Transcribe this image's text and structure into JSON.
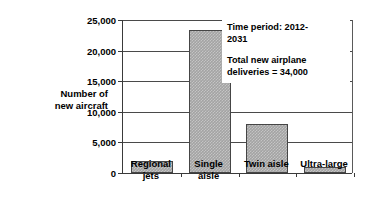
{
  "chart_data": {
    "type": "bar",
    "title": "",
    "subtitle": "",
    "xlabel": "",
    "ylabel": "Number of new aircraft",
    "ylabel_lines": [
      "Number of",
      "new aircraft"
    ],
    "categories": [
      "Regional jets",
      "Single aisle",
      "Twin aisle",
      "Ultra-large"
    ],
    "category_lines": [
      [
        "Regional",
        "jets"
      ],
      [
        "Single",
        "aisle"
      ],
      [
        "Twin aisle"
      ],
      [
        "Ultra-large"
      ]
    ],
    "values": [
      2000,
      23300,
      8000,
      1000
    ],
    "ylim": [
      0,
      25000
    ],
    "ytick_values": [
      0,
      5000,
      10000,
      15000,
      20000,
      25000
    ],
    "ytick_labels": [
      "0",
      "5,000",
      "10,000",
      "15,000",
      "20,000",
      "25,000"
    ],
    "grid": true,
    "grid_axis": "y",
    "legend": false,
    "legend_position": "none",
    "bar_fill_color": "#a3a3a3",
    "bar_edge_color": "#454545",
    "axis_color": "#3a3a3a",
    "background_color": "#ffffff",
    "annotations": [
      {
        "name": "time-period",
        "lines": [
          "Time period: 2012-",
          "2031"
        ]
      },
      {
        "name": "total-deliveries",
        "lines": [
          "Total new airplane",
          "deliveries = 34,000"
        ]
      }
    ]
  },
  "annotation_box": {
    "time_period_line1": "Time period: 2012-",
    "time_period_line2": "2031",
    "total_line1": "Total new airplane",
    "total_line2": "deliveries = 34,000"
  },
  "y_axis": {
    "title_line1": "Number of",
    "title_line2": "new aircraft",
    "labels": [
      "25,000",
      "20,000",
      "15,000",
      "10,000",
      "5,000",
      "0"
    ]
  },
  "x_axis": {
    "labels": [
      {
        "line1": "Regional",
        "line2": "jets"
      },
      {
        "line1": "Single",
        "line2": "aisle"
      },
      {
        "line1": "Twin aisle",
        "line2": ""
      },
      {
        "line1": "Ultra-large",
        "line2": ""
      }
    ]
  }
}
